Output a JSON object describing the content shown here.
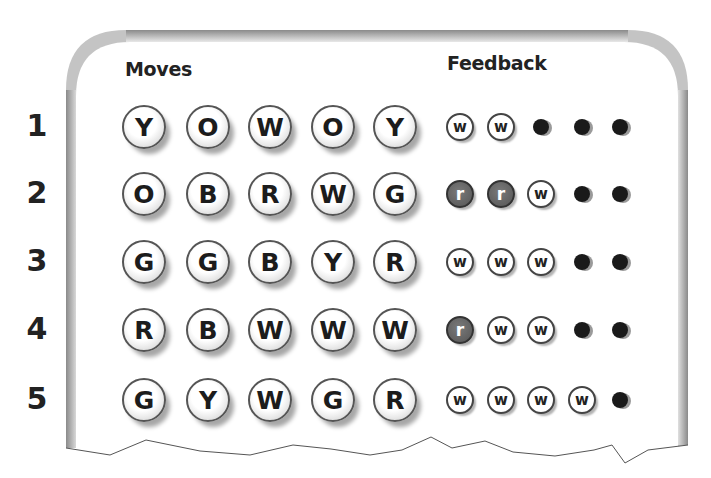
{
  "headers": {
    "moves": "Moves",
    "feedback": "Feedback"
  },
  "rows": [
    {
      "num": "1",
      "moves": [
        "Y",
        "O",
        "W",
        "O",
        "Y"
      ],
      "feedback": [
        "w",
        "w",
        "empty",
        "empty",
        "empty"
      ]
    },
    {
      "num": "2",
      "moves": [
        "O",
        "B",
        "R",
        "W",
        "G"
      ],
      "feedback": [
        "r",
        "r",
        "w",
        "empty",
        "empty"
      ]
    },
    {
      "num": "3",
      "moves": [
        "G",
        "G",
        "B",
        "Y",
        "R"
      ],
      "feedback": [
        "w",
        "w",
        "w",
        "empty",
        "empty"
      ]
    },
    {
      "num": "4",
      "moves": [
        "R",
        "B",
        "W",
        "W",
        "W"
      ],
      "feedback": [
        "r",
        "w",
        "w",
        "empty",
        "empty"
      ]
    },
    {
      "num": "5",
      "moves": [
        "G",
        "Y",
        "W",
        "G",
        "R"
      ],
      "feedback": [
        "w",
        "w",
        "w",
        "w",
        "empty"
      ]
    }
  ],
  "colors": {
    "border": "#9c9c9c",
    "red_peg": "#5e5e5e",
    "empty_peg": "#1a1a1a"
  }
}
